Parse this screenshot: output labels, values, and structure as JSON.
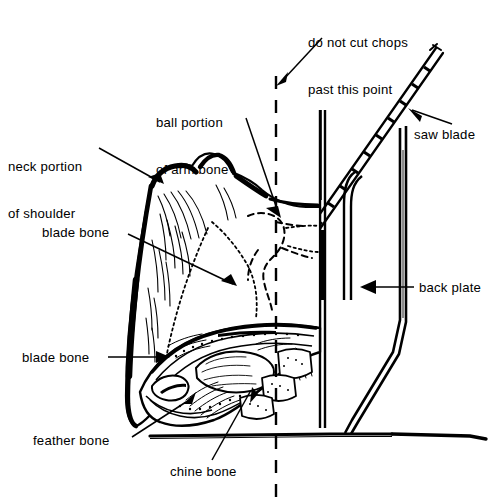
{
  "diagram": {
    "background_color": "#ffffff",
    "ink_color": "#000000",
    "width": 497,
    "height": 500
  },
  "labels": [
    {
      "id": "do-not-cut",
      "name": "do-not-cut-chops-label",
      "line1": "do not cut chops",
      "line2": "past this point",
      "x": 308,
      "y": 4,
      "align": "left"
    },
    {
      "id": "ball-portion",
      "name": "ball-portion-arm-bone-label",
      "line1": "ball portion",
      "line2": "of arm bone",
      "x": 156,
      "y": 84,
      "align": "left"
    },
    {
      "id": "neck-portion",
      "name": "neck-portion-shoulder-label",
      "line1": "neck portion",
      "line2": "of shoulder",
      "x": 8,
      "y": 128,
      "align": "left"
    },
    {
      "id": "saw-blade",
      "name": "saw-blade-label",
      "line1": "saw blade",
      "line2": "",
      "x": 414,
      "y": 127,
      "align": "left"
    },
    {
      "id": "blade-bone-1",
      "name": "blade-bone-upper-label",
      "line1": "blade bone",
      "line2": "",
      "x": 42,
      "y": 225,
      "align": "left"
    },
    {
      "id": "back-plate",
      "name": "back-plate-label",
      "line1": "back plate",
      "line2": "",
      "x": 419,
      "y": 280,
      "align": "left"
    },
    {
      "id": "blade-bone-2",
      "name": "blade-bone-lower-label",
      "line1": "blade bone",
      "line2": "",
      "x": 22,
      "y": 350,
      "align": "left"
    },
    {
      "id": "feather-bone",
      "name": "feather-bone-label",
      "line1": "feather bone",
      "line2": "",
      "x": 33,
      "y": 433,
      "align": "left"
    },
    {
      "id": "chine-bone",
      "name": "chine-bone-label",
      "line1": "chine bone",
      "line2": "",
      "x": 170,
      "y": 464,
      "align": "left"
    }
  ],
  "parts": {
    "cut_line_name": "do-not-cut-dashed-line",
    "saw_blade_name": "saw-blade-shape",
    "back_plate_name": "back-plate-shape",
    "table_name": "saw-table-surface",
    "meat_name": "pork-shoulder-cut",
    "bone_section_name": "bone-cross-section"
  }
}
